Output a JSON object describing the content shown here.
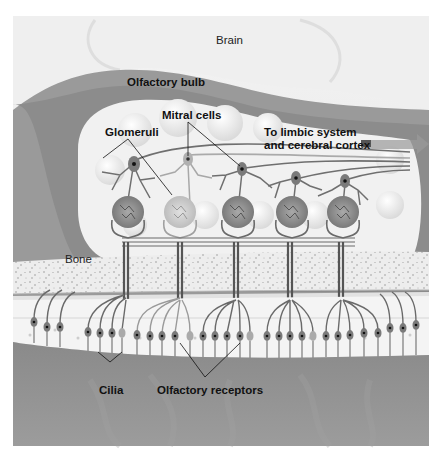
{
  "diagram": {
    "colors": {
      "background": "#ffffff",
      "brain": "#e9e9e9",
      "bulb_wall": "#8f8f8f",
      "bulb_interior": "#f1f1f1",
      "bone": "#ececec",
      "mucosa": "#8a8a8a",
      "neuron": "#6f6f6f",
      "nucleus": "#1a1a1a",
      "arrow": "#9a9a9a"
    },
    "labels": {
      "brain": "Brain",
      "olfactory_bulb": "Olfactory bulb",
      "mitral_cells": "Mitral cells",
      "glomeruli": "Glomeruli",
      "limbic_line1": "To limbic system",
      "limbic_line2": "and cerebral cortex",
      "bone": "Bone",
      "cilia": "Cilia",
      "olfactory_receptors": "Olfactory receptors"
    },
    "counts": {
      "glomeruli": 5,
      "mitral_cells": 5
    }
  }
}
